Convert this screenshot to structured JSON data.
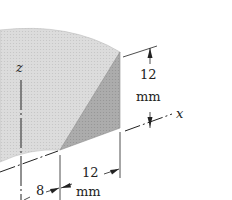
{
  "diagram": {
    "type": "engineering-solid-figure",
    "axes": [
      {
        "name": "z",
        "label": "z"
      },
      {
        "name": "x",
        "label": "x"
      }
    ],
    "dimensions": [
      {
        "id": "height",
        "value": "12",
        "unit": "mm"
      },
      {
        "id": "width",
        "value": "12",
        "unit": "mm"
      },
      {
        "id": "thickness",
        "value": "8",
        "unit": ""
      }
    ],
    "colors": {
      "light_face": "#d9d9d9",
      "dark_face": "#a9a9a9",
      "line": "#222222",
      "background": "#ffffff"
    }
  }
}
